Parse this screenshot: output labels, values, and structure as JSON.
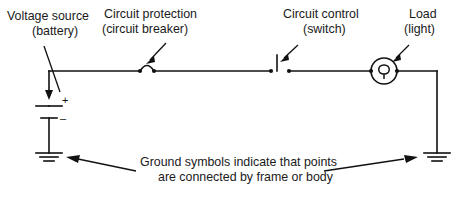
{
  "diagram": {
    "background_color": "#ffffff",
    "line_color": "#111111",
    "text_color": "#1a1a1a",
    "labels": {
      "voltage_source_line1": "Voltage source",
      "voltage_source_line2": "(battery)",
      "circuit_protection_line1": "Circuit protection",
      "circuit_protection_line2": "(circuit breaker)",
      "circuit_control_line1": "Circuit control",
      "circuit_control_line2": "(switch)",
      "load_line1": "Load",
      "load_line2": "(light)",
      "caption_line1": "Ground symbols indicate that points",
      "caption_line2": "are connected by frame or body",
      "battery_positive": "+",
      "battery_negative": "–"
    },
    "components": [
      {
        "name": "battery",
        "symbol": "battery-symbol",
        "label": "Voltage source (battery)",
        "polarity_top": "+",
        "polarity_bottom": "–"
      },
      {
        "name": "circuit-breaker",
        "symbol": "circuit-breaker-symbol",
        "label": "Circuit protection (circuit breaker)"
      },
      {
        "name": "switch",
        "symbol": "switch-symbol",
        "label": "Circuit control (switch)"
      },
      {
        "name": "lamp",
        "symbol": "lamp-symbol",
        "label": "Load (light)"
      },
      {
        "name": "ground-left",
        "symbol": "ground-symbol",
        "label": "Ground"
      },
      {
        "name": "ground-right",
        "symbol": "ground-symbol",
        "label": "Ground"
      }
    ]
  }
}
